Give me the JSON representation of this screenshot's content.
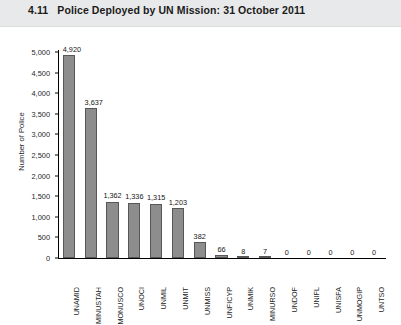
{
  "header": {
    "figure_number": "4.11",
    "title": "4.11   Police Deployed by UN Mission: 31 October 2011"
  },
  "chart_data": {
    "type": "bar",
    "title": "Police Deployed by UN Mission: 31 October 2011",
    "xlabel": "",
    "ylabel": "Number of Police",
    "ylim": [
      0,
      5000
    ],
    "ytick_labels": [
      "5,000",
      "4,500",
      "4,000",
      "3,500",
      "3,000",
      "2,500",
      "2,000",
      "1,500",
      "1,000",
      "500",
      "0"
    ],
    "ytick_values": [
      5000,
      4500,
      4000,
      3500,
      3000,
      2500,
      2000,
      1500,
      1000,
      500,
      0
    ],
    "grid": false,
    "legend": false,
    "bar_color": "#8d8d8d",
    "bar_edge_color": "#575757",
    "categories": [
      "UNAMID",
      "MINUSTAH",
      "MONUSCO",
      "UNOCI",
      "UNMIL",
      "UNMIT",
      "UNMISS",
      "UNFICYP",
      "UNMIK",
      "MINURSO",
      "UNDOF",
      "UNIFL",
      "UNISFA",
      "UNMOGIP",
      "UNTSO"
    ],
    "values": [
      4920,
      3637,
      1362,
      1336,
      1315,
      1203,
      382,
      66,
      8,
      7,
      0,
      0,
      0,
      0,
      0
    ],
    "value_labels": [
      "4,920",
      "3,637",
      "1,362",
      "1,336",
      "1,315",
      "1,203",
      "382",
      "66",
      "8",
      "7",
      "0",
      "0",
      "0",
      "0",
      "0"
    ]
  }
}
